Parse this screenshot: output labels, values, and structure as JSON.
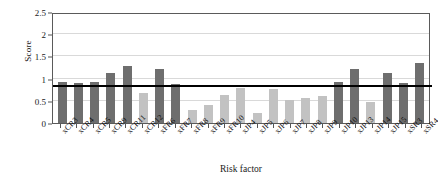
{
  "chart_data": {
    "type": "bar",
    "title": "",
    "xlabel": "Risk factor",
    "ylabel": "Score",
    "ylim": [
      0,
      2.5
    ],
    "yticks": [
      0,
      0.5,
      1,
      1.5,
      2,
      2.5
    ],
    "ytick_labels": [
      "0",
      "0.5",
      "1",
      "1.5",
      "2",
      "2.5"
    ],
    "grid": true,
    "legend": "none",
    "threshold_line": 0.82,
    "colors": {
      "above_threshold_bar": "#6e6e6e",
      "below_threshold_bar": "#c2c2c2",
      "threshold_line": "#000000",
      "gridline": "#d9d9d9",
      "axis": "#5a5a5a"
    },
    "categories": [
      "xCR3",
      "xCR4",
      "xCR5",
      "xCR9",
      "xCR11",
      "xCR12",
      "xFR6",
      "xFR7",
      "xFR8",
      "xFR9",
      "xFR10",
      "xJP4",
      "xJP5",
      "xJP6",
      "xJP7",
      "xJP8",
      "xJP9",
      "xJP10",
      "xJP13",
      "xJP14",
      "xJP15",
      "xSR3",
      "xSR4"
    ],
    "values": [
      0.92,
      0.9,
      0.93,
      1.13,
      1.28,
      0.68,
      1.22,
      0.87,
      0.3,
      0.41,
      0.62,
      0.78,
      0.22,
      0.76,
      0.52,
      0.57,
      0.6,
      0.93,
      1.22,
      0.47,
      1.12,
      0.9,
      1.35
    ],
    "bar_shades": [
      "dark",
      "dark",
      "dark",
      "dark",
      "dark",
      "light",
      "dark",
      "dark",
      "light",
      "light",
      "light",
      "light",
      "light",
      "light",
      "light",
      "light",
      "light",
      "dark",
      "dark",
      "light",
      "dark",
      "dark",
      "dark"
    ]
  }
}
